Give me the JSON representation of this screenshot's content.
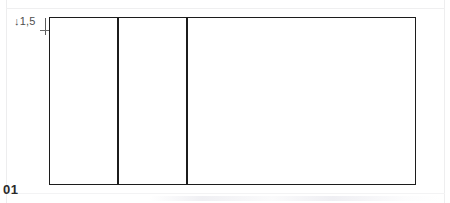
{
  "page": {
    "number_label": "01",
    "background_color": "#ffffff",
    "line_color": "#1c1c1c"
  },
  "drawing": {
    "name": "rectangular-frame-with-two-vertical-dividers",
    "dimension": {
      "arrow_glyph": "↓",
      "value": "1,5",
      "icon_name": "down-arrow-icon"
    },
    "cells": [
      {
        "label": ""
      },
      {
        "label": ""
      },
      {
        "label": ""
      }
    ]
  }
}
